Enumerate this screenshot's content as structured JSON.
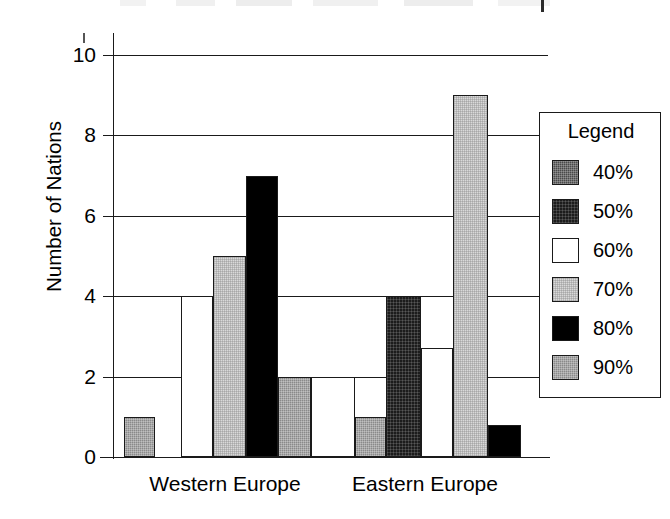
{
  "chart_data": {
    "type": "bar",
    "title": "",
    "xlabel": "",
    "ylabel": "Number of Nations",
    "ylim": [
      0,
      10
    ],
    "ytick_values": [
      0,
      2,
      4,
      6,
      8,
      10
    ],
    "ytick_labels": [
      "0",
      "2",
      "4",
      "6",
      "8",
      "10"
    ],
    "grid": true,
    "legend_position": "right",
    "legend_title": "Legend",
    "categories": [
      "Western Europe",
      "Eastern Europe"
    ],
    "series": [
      {
        "name": "40%",
        "color": "#4a4a4a",
        "values": [
          0,
          0
        ]
      },
      {
        "name": "50%",
        "color": "#1c1c1c",
        "values": [
          0,
          4
        ]
      },
      {
        "name": "60%",
        "color": "#ffffff",
        "values": [
          4,
          2.7
        ]
      },
      {
        "name": "70%",
        "color": "#d9d9d9",
        "values": [
          5,
          9
        ]
      },
      {
        "name": "80%",
        "color": "#000000",
        "values": [
          7,
          0.8
        ]
      },
      {
        "name": "90%",
        "color": "#8a8a8a",
        "values": [
          2,
          1
        ]
      }
    ],
    "bars": [
      {
        "group": "Western Europe",
        "series": "90%",
        "value": 1,
        "x": 11,
        "w": 31
      },
      {
        "group": "Western Europe",
        "series": "60%",
        "value": 4,
        "x": 68,
        "w": 32
      },
      {
        "group": "Western Europe",
        "series": "70%",
        "value": 5,
        "x": 100,
        "w": 33
      },
      {
        "group": "Western Europe",
        "series": "80%",
        "value": 7,
        "x": 133,
        "w": 32
      },
      {
        "group": "Western Europe",
        "series": "90%",
        "value": 2,
        "x": 165,
        "w": 33
      },
      {
        "group": "Eastern Europe",
        "series": "60%",
        "value": 2,
        "x": 198,
        "w": 44
      },
      {
        "group": "Eastern Europe",
        "series": "90%",
        "value": 1,
        "x": 242,
        "w": 31
      },
      {
        "group": "Eastern Europe",
        "series": "50%",
        "value": 4,
        "x": 273,
        "w": 35
      },
      {
        "group": "Eastern Europe",
        "series": "60%",
        "value": 2.7,
        "x": 308,
        "w": 32
      },
      {
        "group": "Eastern Europe",
        "series": "70%",
        "value": 9,
        "x": 340,
        "w": 35
      },
      {
        "group": "Eastern Europe",
        "series": "80%",
        "value": 0.8,
        "x": 375,
        "w": 33
      }
    ]
  },
  "axis": {
    "y_title": "Number of Nations",
    "ticks": [
      {
        "label": "10",
        "value": 10
      },
      {
        "label": "8",
        "value": 8
      },
      {
        "label": "6",
        "value": 6
      },
      {
        "label": "4",
        "value": 4
      },
      {
        "label": "2",
        "value": 2
      },
      {
        "label": "0",
        "value": 0
      }
    ]
  },
  "categories": [
    {
      "label": "Western Europe"
    },
    {
      "label": "Eastern Europe"
    }
  ],
  "legend": {
    "title": "Legend",
    "items": [
      {
        "label": "40%",
        "swatch": "fill-40"
      },
      {
        "label": "50%",
        "swatch": "fill-50"
      },
      {
        "label": "60%",
        "swatch": "fill-60"
      },
      {
        "label": "70%",
        "swatch": "fill-70"
      },
      {
        "label": "80%",
        "swatch": "fill-80"
      },
      {
        "label": "90%",
        "swatch": "fill-90"
      }
    ]
  }
}
